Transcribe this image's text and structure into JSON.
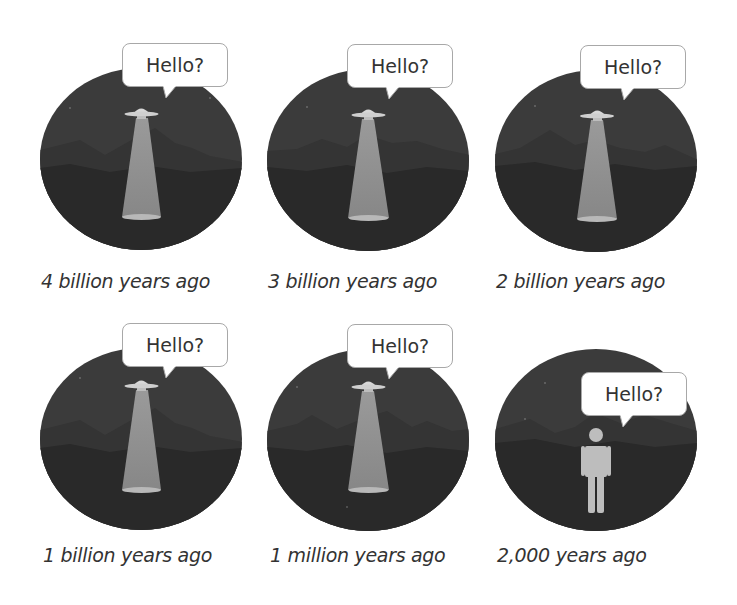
{
  "colors": {
    "background": "#ffffff",
    "sky": "#3b3b3b",
    "mountains_far": "#353535",
    "ground": "#282828",
    "beam": "#8a8a8a",
    "ufo": "#cfcfcf",
    "person": "#bdbdbd",
    "bubble_border": "#a8a8a8",
    "text": "#333333"
  },
  "panels": [
    {
      "speaker": "ufo",
      "speech": "Hello?",
      "caption": "4 billion years ago"
    },
    {
      "speaker": "ufo",
      "speech": "Hello?",
      "caption": "3 billion years ago"
    },
    {
      "speaker": "ufo",
      "speech": "Hello?",
      "caption": "2 billion years ago"
    },
    {
      "speaker": "ufo",
      "speech": "Hello?",
      "caption": "1 billion years ago"
    },
    {
      "speaker": "ufo",
      "speech": "Hello?",
      "caption": "1 million years ago"
    },
    {
      "speaker": "person",
      "speech": "Hello?",
      "caption": "2,000 years ago"
    }
  ]
}
